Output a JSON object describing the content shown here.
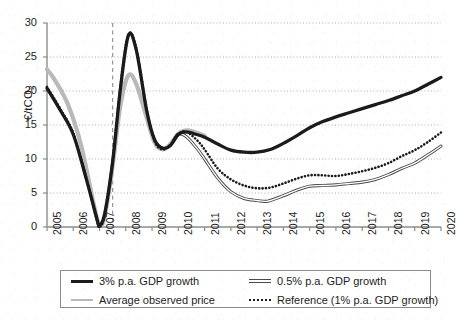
{
  "chart_data": {
    "type": "line",
    "title": "",
    "xlabel": "",
    "ylabel": "€/tCO2",
    "ylabel_text": "€/tCO",
    "ylabel_sub": "2",
    "xlim": [
      2005,
      2020
    ],
    "ylim": [
      0,
      30
    ],
    "yticks": [
      0,
      5,
      10,
      15,
      20,
      25,
      30
    ],
    "xticks": [
      "2005",
      "2006",
      "2007",
      "2008",
      "2009",
      "2010",
      "2011",
      "2012",
      "2013",
      "2014",
      "2015",
      "2016",
      "2017",
      "2018",
      "2019",
      "2020"
    ],
    "grid": "horizontal-dotted",
    "legend_position": "below-plot",
    "annotations": [
      {
        "name": "forecast-divider",
        "type": "vertical-dashed-line",
        "x": 2007.5
      }
    ],
    "series": [
      {
        "name": "3% p.a. GDP growth",
        "style": "thick-solid-black",
        "color": "#1b1b1b",
        "x": [
          2005.0,
          2005.5,
          2006.0,
          2006.5,
          2006.9,
          2007.0,
          2007.2,
          2007.5,
          2007.8,
          2008.1,
          2008.4,
          2008.8,
          2009.1,
          2009.4,
          2009.7,
          2010.0,
          2010.3,
          2010.7,
          2011.0,
          2011.5,
          2012.0,
          2012.5,
          2013.0,
          2013.5,
          2014.0,
          2014.5,
          2015.0,
          2015.5,
          2016.0,
          2016.5,
          2017.0,
          2017.5,
          2018.0,
          2018.5,
          2019.0,
          2019.5,
          2020.0
        ],
        "y": [
          20.4,
          17.2,
          13.6,
          7.0,
          1.2,
          0.2,
          2.0,
          9.6,
          20.5,
          28.2,
          26.0,
          17.0,
          12.8,
          11.6,
          12.0,
          13.6,
          14.0,
          13.6,
          13.2,
          12.2,
          11.3,
          11.0,
          11.0,
          11.4,
          12.3,
          13.4,
          14.6,
          15.5,
          16.2,
          16.8,
          17.4,
          18.0,
          18.6,
          19.3,
          20.0,
          21.0,
          22.0
        ]
      },
      {
        "name": "Average observed price",
        "style": "thick-solid-gray",
        "color": "#b9b9b9",
        "x": [
          2005.0,
          2005.3,
          2005.8,
          2006.3,
          2006.8,
          2007.0,
          2007.2,
          2007.5,
          2007.8,
          2008.1,
          2008.4,
          2008.8,
          2009.1,
          2009.4,
          2009.7,
          2010.0,
          2010.3,
          2010.6,
          2011.0
        ],
        "y": [
          23.2,
          21.6,
          18.0,
          12.0,
          3.0,
          0.3,
          1.6,
          9.0,
          18.0,
          22.3,
          21.0,
          16.0,
          12.4,
          11.4,
          12.2,
          13.7,
          14.2,
          14.0,
          13.4
        ]
      },
      {
        "name": "0.5% p.a. GDP growth",
        "style": "thin-double-line",
        "color": "#4a4a4a",
        "x": [
          2009.8,
          2010.0,
          2010.3,
          2010.7,
          2011.0,
          2011.5,
          2012.0,
          2012.5,
          2013.0,
          2013.4,
          2014.0,
          2014.5,
          2015.0,
          2015.5,
          2016.0,
          2016.5,
          2017.0,
          2017.5,
          2018.0,
          2018.5,
          2019.0,
          2019.5,
          2020.0
        ],
        "y": [
          12.6,
          13.7,
          13.3,
          11.6,
          10.0,
          7.2,
          5.2,
          4.2,
          3.9,
          3.8,
          4.6,
          5.4,
          6.0,
          6.1,
          6.2,
          6.4,
          6.6,
          7.0,
          7.7,
          8.6,
          9.4,
          10.6,
          11.9
        ]
      },
      {
        "name": "Reference (1% p.a. GDP growth)",
        "style": "dotted-black",
        "color": "#1b1b1b",
        "x": [
          2005.0,
          2005.5,
          2006.0,
          2006.5,
          2006.9,
          2007.0,
          2007.2,
          2007.5,
          2007.8,
          2008.1,
          2008.4,
          2008.8,
          2009.1,
          2009.4,
          2009.7,
          2010.0,
          2010.3,
          2010.7,
          2011.0,
          2011.5,
          2012.0,
          2012.5,
          2013.0,
          2013.5,
          2014.0,
          2014.5,
          2015.0,
          2015.5,
          2016.0,
          2016.5,
          2017.0,
          2017.5,
          2018.0,
          2018.5,
          2019.0,
          2019.5,
          2020.0
        ],
        "y": [
          20.6,
          17.4,
          13.8,
          7.2,
          1.0,
          0.0,
          1.8,
          9.8,
          20.8,
          28.3,
          26.2,
          17.2,
          12.6,
          11.4,
          12.1,
          13.7,
          14.0,
          12.8,
          11.4,
          8.6,
          7.0,
          6.1,
          5.7,
          5.8,
          6.4,
          7.1,
          7.6,
          7.6,
          7.5,
          7.8,
          8.2,
          8.7,
          9.4,
          10.4,
          11.3,
          12.5,
          13.9
        ]
      }
    ]
  },
  "legend": {
    "items": [
      {
        "label": "3% p.a. GDP growth",
        "sample": "thick-solid-black-swatch"
      },
      {
        "label": "0.5% p.a. GDP growth",
        "sample": "thin-double-line-swatch"
      },
      {
        "label": "Average observed price",
        "sample": "thick-solid-gray-swatch"
      },
      {
        "label": "Reference (1% p.a. GDP growth)",
        "sample": "dotted-black-swatch"
      }
    ]
  }
}
